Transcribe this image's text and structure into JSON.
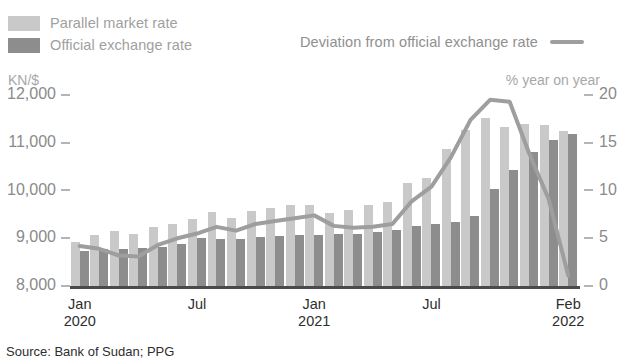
{
  "legend": {
    "parallel_label": "Parallel market rate",
    "official_label": "Official exchange rate",
    "deviation_label": "Deviation from official exchange rate",
    "parallel_color": "#c9c9c9",
    "official_color": "#8d8d8d",
    "line_color": "#9e9e9e"
  },
  "axes": {
    "left_caption": "KN/$",
    "right_caption": "% year on year"
  },
  "source": {
    "text": "Source: Bank of Sudan; PPG"
  },
  "chart_data": {
    "type": "bar",
    "title": "",
    "subtitle": "",
    "xlabel": "",
    "ylabel": "KN/$",
    "y2label": "% year on year",
    "grid": false,
    "legend_position": "top",
    "ylim": [
      8000,
      12000
    ],
    "y2lim": [
      0,
      20
    ],
    "ytick_labels": [
      "12,000",
      "11,000",
      "10,000",
      "9,000",
      "8,000"
    ],
    "ytick_values": [
      12000,
      11000,
      10000,
      9000,
      8000
    ],
    "y2tick_labels": [
      "20",
      "15",
      "10",
      "5",
      "0"
    ],
    "y2tick_values": [
      20,
      15,
      10,
      5,
      0
    ],
    "xtick_labels": [
      {
        "month": "Jan",
        "year": "2020",
        "index": 0
      },
      {
        "month": "Jul",
        "year": "",
        "index": 6
      },
      {
        "month": "Jan",
        "year": "2021",
        "index": 12
      },
      {
        "month": "Jul",
        "year": "",
        "index": 18
      },
      {
        "month": "Feb",
        "year": "2022",
        "index": 25
      }
    ],
    "categories": [
      "Jan 2020",
      "Feb 2020",
      "Mar 2020",
      "Apr 2020",
      "May 2020",
      "Jun 2020",
      "Jul 2020",
      "Aug 2020",
      "Sep 2020",
      "Oct 2020",
      "Nov 2020",
      "Dec 2020",
      "Jan 2021",
      "Feb 2021",
      "Mar 2021",
      "Apr 2021",
      "May 2021",
      "Jun 2021",
      "Jul 2021",
      "Aug 2021",
      "Sep 2021",
      "Oct 2021",
      "Nov 2021",
      "Dec 2021",
      "Jan 2022",
      "Feb 2022"
    ],
    "series": [
      {
        "name": "Parallel market rate",
        "axis": "left",
        "color": "#c9c9c9",
        "values": [
          8950,
          9080,
          9180,
          9120,
          9250,
          9330,
          9430,
          9580,
          9450,
          9600,
          9650,
          9720,
          9720,
          9560,
          9620,
          9720,
          9790,
          10180,
          10280,
          10880,
          11280,
          11530,
          11350,
          11420,
          11400,
          11260
        ]
      },
      {
        "name": "Official exchange rate",
        "axis": "left",
        "color": "#8d8d8d",
        "values": [
          8760,
          8790,
          8800,
          8810,
          8840,
          8900,
          9020,
          9000,
          9010,
          9050,
          9060,
          9080,
          9080,
          9100,
          9120,
          9160,
          9200,
          9280,
          9310,
          9370,
          9480,
          10060,
          10460,
          10820,
          11080,
          11200
        ]
      },
      {
        "name": "Deviation from official exchange rate",
        "axis": "right",
        "type": "line",
        "color": "#9e9e9e",
        "values": [
          4.3,
          4.0,
          3.3,
          3.2,
          4.4,
          5.1,
          5.6,
          6.3,
          5.9,
          6.6,
          6.9,
          7.2,
          7.5,
          6.4,
          6.2,
          6.3,
          6.6,
          9.0,
          10.5,
          13.6,
          17.5,
          19.6,
          19.4,
          14.0,
          9.2,
          1.2
        ]
      }
    ]
  }
}
